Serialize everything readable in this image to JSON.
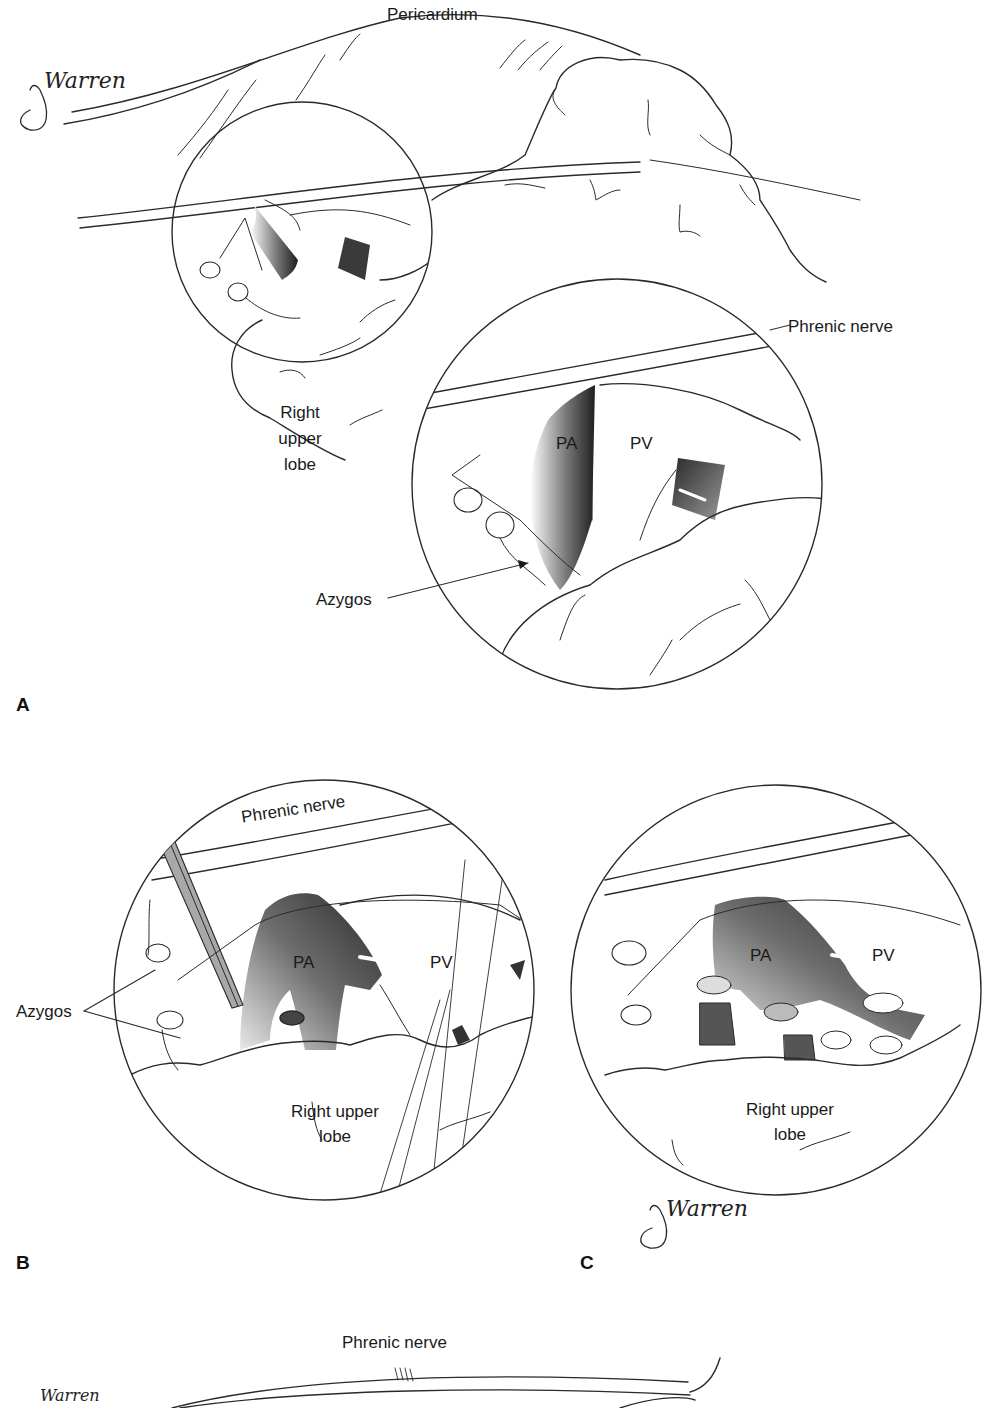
{
  "figure": {
    "panels": [
      {
        "id": "A",
        "letter": "A",
        "labels": {
          "pericardium": "Pericardium",
          "phrenic_nerve": "Phrenic nerve",
          "right_upper_lobe": [
            "Right",
            "upper",
            "lobe"
          ],
          "pa": "PA",
          "pv": "PV",
          "azygos": "Azygos"
        },
        "signature": "Warren"
      },
      {
        "id": "B",
        "letter": "B",
        "labels": {
          "phrenic_nerve": "Phrenic nerve",
          "pa": "PA",
          "pv": "PV",
          "azygos": "Azygos",
          "right_upper_lobe": [
            "Right upper",
            "lobe"
          ]
        }
      },
      {
        "id": "C",
        "letter": "C",
        "labels": {
          "pa": "PA",
          "pv": "PV",
          "right_upper_lobe": [
            "Right upper",
            "lobe"
          ]
        },
        "signature": "Warren"
      },
      {
        "id": "D",
        "labels": {
          "phrenic_nerve": "Phrenic nerve"
        },
        "signature": "Warren"
      }
    ],
    "colors": {
      "line": "#2a2a2a",
      "vessel_dark": "#2b2b2b",
      "vessel_mid": "#8a8a8a",
      "background": "#ffffff"
    }
  }
}
